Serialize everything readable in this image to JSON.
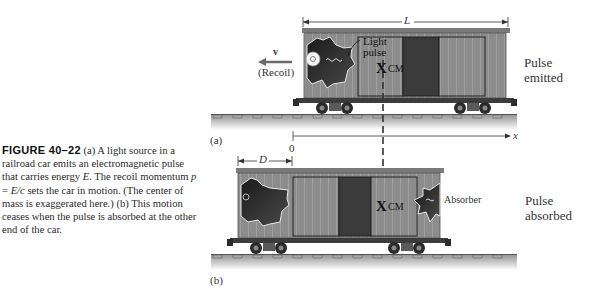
{
  "figure": {
    "number_label": "FIGURE 40–22",
    "caption_parts": {
      "a1": "(a) A light source in a railroad car emits an electromagnetic pulse that carries energy ",
      "E": "E",
      "a2": ". The recoil momentum ",
      "p": "p",
      "eq": " = ",
      "Ec": "E/c",
      "a3": " sets the car in motion. (The center of mass is exaggerated here.) (b) This motion ceases when the pulse is absorbed at the other end of the car."
    }
  },
  "panel_a": {
    "label": "(a)",
    "length_label": "L",
    "velocity_label": "v",
    "recoil_label": "(Recoil)",
    "light_pulse_label_1": "Light",
    "light_pulse_label_2": "pulse",
    "cm_mark": "X",
    "cm_label": "CM",
    "axis_origin": "0",
    "axis_label": "x",
    "side_label_1": "Pulse",
    "side_label_2": "emitted"
  },
  "panel_b": {
    "label": "(b)",
    "displacement_label": "D",
    "cm_mark": "X",
    "cm_label": "CM",
    "absorber_label": "Absorber",
    "side_label_1": "Pulse",
    "side_label_2": "absorbed"
  },
  "colors": {
    "car_body": "#8a8a8a",
    "car_dark_door": "#3a3a3a",
    "rail_top": "#9a9a9a",
    "rail_fade": "#ffffff",
    "recoil_arrow": "#6a6a6a"
  }
}
